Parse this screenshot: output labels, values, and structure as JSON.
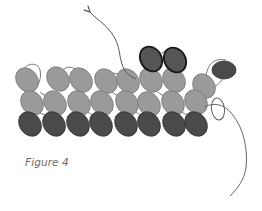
{
  "figure": {
    "caption": "Figure 4",
    "colors": {
      "light_bead": "#9a9a9a",
      "light_bead_stroke": "#7a7a7a",
      "dark_bead": "#4a4a4a",
      "dark_bead_stroke": "#333333",
      "highlight_stroke": "#1a1a1a",
      "thread": "#555555"
    },
    "rows": [
      {
        "name": "top-row",
        "shade": "light",
        "beads": [
          [
            27,
            80
          ],
          [
            58,
            79
          ],
          [
            81,
            80
          ],
          [
            106,
            81
          ],
          [
            128,
            81
          ],
          [
            151,
            80
          ],
          [
            174,
            80
          ],
          [
            204,
            86
          ]
        ]
      },
      {
        "name": "middle-row",
        "shade": "light",
        "beads": [
          [
            32,
            103
          ],
          [
            55,
            103
          ],
          [
            79,
            103
          ],
          [
            102,
            103
          ],
          [
            127,
            103
          ],
          [
            149,
            104
          ],
          [
            173,
            103
          ],
          [
            196,
            102
          ]
        ]
      },
      {
        "name": "bottom-row",
        "shade": "dark",
        "beads": [
          [
            30,
            124
          ],
          [
            54,
            124
          ],
          [
            78,
            124
          ],
          [
            101,
            124
          ],
          [
            126,
            124
          ],
          [
            149,
            124
          ],
          [
            174,
            124
          ],
          [
            196,
            124
          ]
        ]
      }
    ],
    "new_beads": [
      [
        151,
        59
      ],
      [
        175,
        60
      ]
    ],
    "end_bead": [
      224,
      70
    ]
  }
}
